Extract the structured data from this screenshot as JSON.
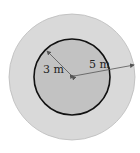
{
  "diagram": {
    "type": "concentric-circles",
    "labels": {
      "inner_radius": "3 m",
      "outer_radius": "5 m"
    },
    "colors": {
      "outer_fill": "#d9d9d9",
      "inner_fill": "#c2c2c2",
      "inner_stroke": "#111111",
      "arrow": "#555555"
    }
  }
}
